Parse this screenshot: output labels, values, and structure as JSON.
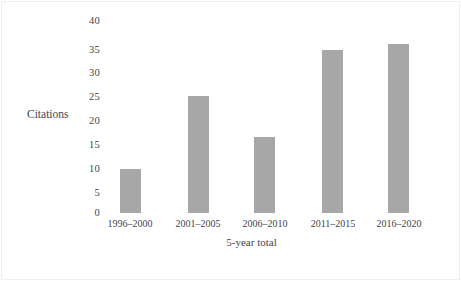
{
  "figure": {
    "background_color": "#ffffff",
    "bar_color": "#a7a7a7",
    "text_color": "#45454a"
  },
  "chart_data": {
    "type": "bar",
    "title": "",
    "subtitle": "",
    "xlabel": "5-year total",
    "ylabel": "Citations",
    "categories": [
      "1996–2000",
      "2001–2005",
      "2006–2010",
      "2011–2015",
      "2016–2020"
    ],
    "values": [
      9,
      24,
      15.5,
      33.5,
      34.7
    ],
    "ylim": [
      0,
      40
    ],
    "yticks": [
      0,
      5,
      10,
      15,
      20,
      25,
      30,
      35,
      40
    ],
    "ytick_labels": [
      "0",
      "5",
      "10",
      "15",
      "20",
      "25",
      "30",
      "35",
      "40"
    ],
    "grid": false,
    "legend": null,
    "series": [
      {
        "name": "Citations",
        "color": "#a7a7a7",
        "values": [
          9,
          24,
          15.5,
          33.5,
          34.7
        ]
      }
    ]
  }
}
